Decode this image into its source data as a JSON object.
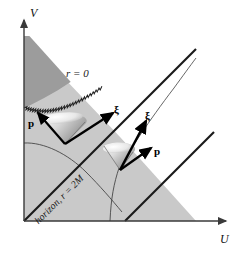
{
  "figure": {
    "type": "kruskal-szekeres-spacetime-diagram",
    "background_color": "#ffffff"
  },
  "axes": {
    "vertical": {
      "label": "V",
      "arrow": "up"
    },
    "horizontal": {
      "label": "U",
      "arrow": "right"
    },
    "axis_color": "#3a3a3a"
  },
  "regions": {
    "singularity_region": {
      "label": "r = 0",
      "fill_color": "#9c9c9c"
    },
    "black_hole_interior": {
      "fill_color": "#c9c9c9"
    },
    "exterior": {
      "fill_color": "#ffffff"
    }
  },
  "curves": {
    "horizon": {
      "label": "horizon, r = 2M",
      "color": "#1a1a1a"
    },
    "singularity_label": "r = 0"
  },
  "vectors": {
    "left_cone": {
      "momentum_label": "p",
      "killing_label": "ξ"
    },
    "right_cone": {
      "momentum_label": "p",
      "killing_label": "ξ"
    }
  },
  "colors": {
    "dark_gray": "#9c9c9c",
    "mid_gray": "#c9c9c9",
    "line_black": "#1a1a1a",
    "thin_line": "#4a4a4a",
    "cone_light": "#f2f2f2",
    "cone_dark": "#8f8f8f"
  }
}
